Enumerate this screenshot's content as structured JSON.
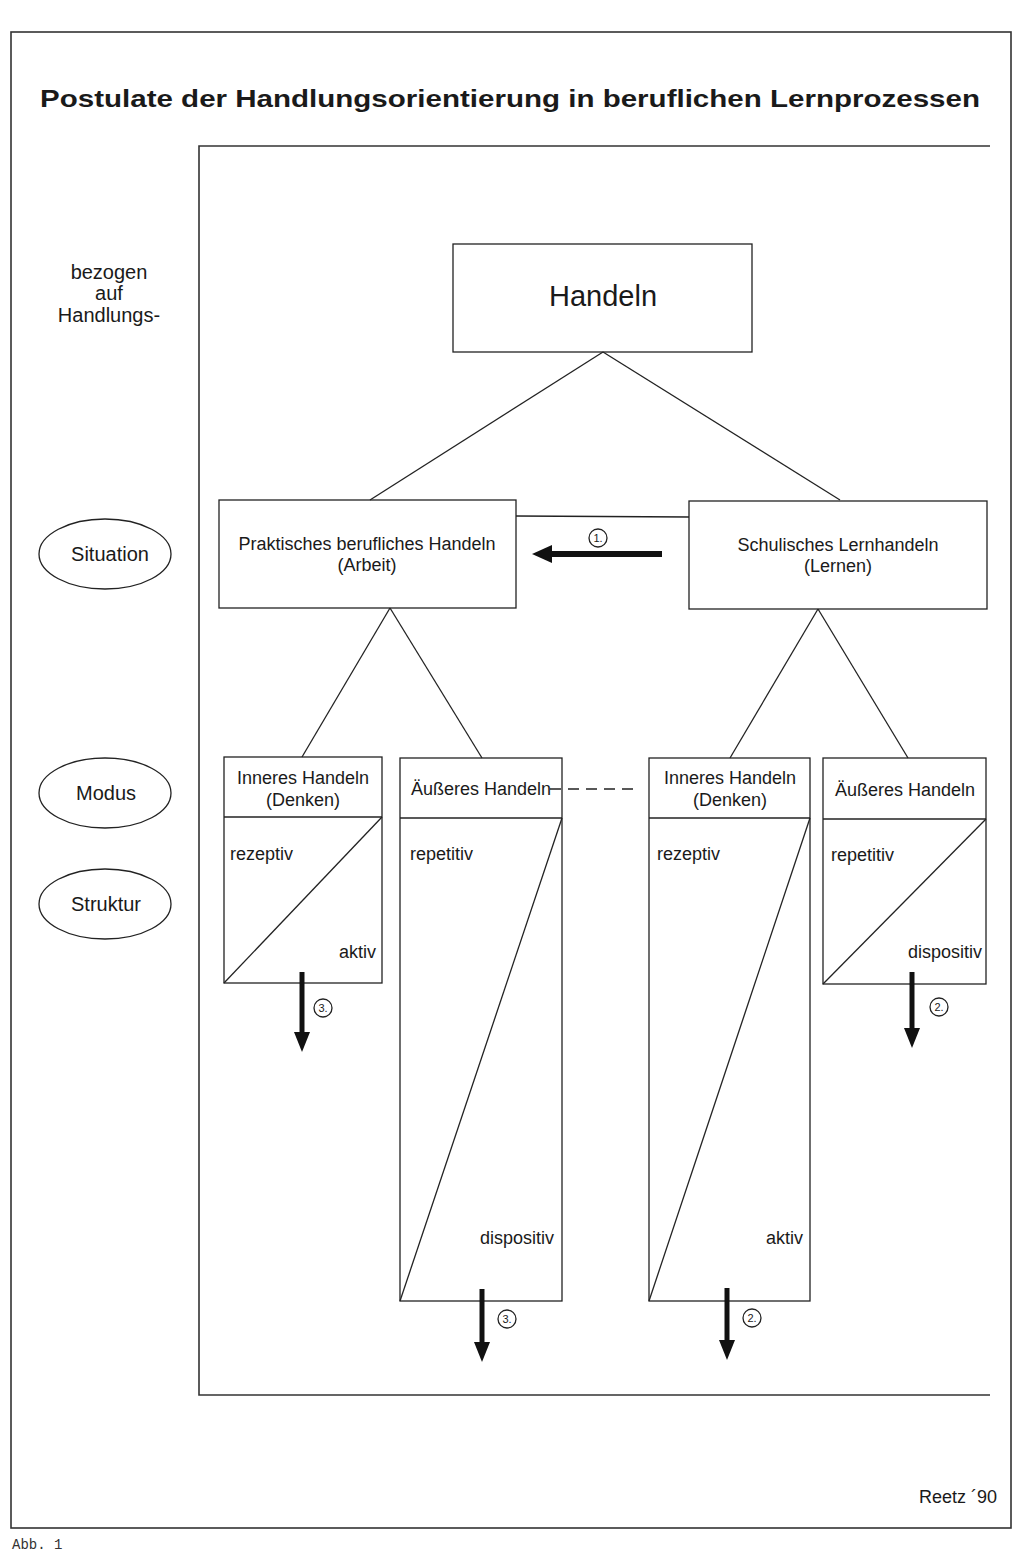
{
  "title": "Postulate der Handlungsorientierung in beruflichen Lernprozessen",
  "side_labels": {
    "header_lines": [
      "bezogen",
      "auf",
      "Handlungs-"
    ],
    "situation": "Situation",
    "modus": "Modus",
    "struktur": "Struktur"
  },
  "root": {
    "label": "Handeln"
  },
  "situations": [
    {
      "line1": "Praktisches berufliches Handeln",
      "line2": "(Arbeit)"
    },
    {
      "line1": "Schulisches Lernhandeln",
      "line2": "(Lernen)"
    }
  ],
  "modes": [
    {
      "line1": "Inneres Handeln",
      "line2": "(Denken)",
      "top_label": "rezeptiv",
      "bottom_label": "aktiv"
    },
    {
      "line1": "Äußeres Handeln",
      "line2": "",
      "top_label": "repetitiv",
      "bottom_label": "dispositiv"
    },
    {
      "line1": "Inneres Handeln",
      "line2": "(Denken)",
      "top_label": "rezeptiv",
      "bottom_label": "aktiv"
    },
    {
      "line1": "Äußeres Handeln",
      "line2": "",
      "top_label": "repetitiv",
      "bottom_label": "dispositiv"
    }
  ],
  "arrows": [
    {
      "marker": "1.",
      "direction": "left"
    },
    {
      "marker": "3.",
      "direction": "down"
    },
    {
      "marker": "2.",
      "direction": "down"
    },
    {
      "marker": "3.",
      "direction": "down"
    },
    {
      "marker": "2.",
      "direction": "down"
    }
  ],
  "credit": "Reetz ´90",
  "caption": "Abb. 1"
}
